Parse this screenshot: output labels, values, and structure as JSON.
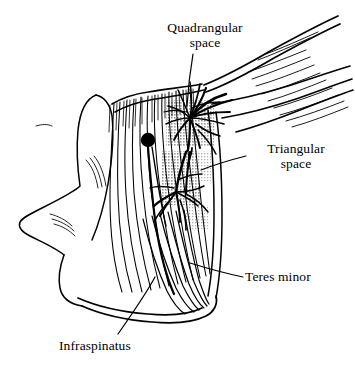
{
  "figure": {
    "background_color": "#ffffff",
    "ink_color": "#000000",
    "shade_color": "#a8a8a8",
    "width": 355,
    "height": 371
  },
  "labels": {
    "quadrangular": {
      "line1": "Quadrangular",
      "line2": "space"
    },
    "triangular": {
      "line1": "Triangular",
      "line2": "space"
    },
    "teres_minor": {
      "line1": "Teres minor"
    },
    "infraspinatus": {
      "line1": "Infraspinatus"
    }
  },
  "markers": {
    "suprascapular_dot": {
      "cx": 148,
      "cy": 140,
      "r": 7
    }
  },
  "shaded_regions": [
    {
      "name": "quadrangular-space-shade",
      "x": 166,
      "y": 100,
      "width": 48,
      "height": 46
    },
    {
      "name": "triangular-space-shade",
      "x": 162,
      "y": 151,
      "width": 38,
      "height": 54
    }
  ]
}
